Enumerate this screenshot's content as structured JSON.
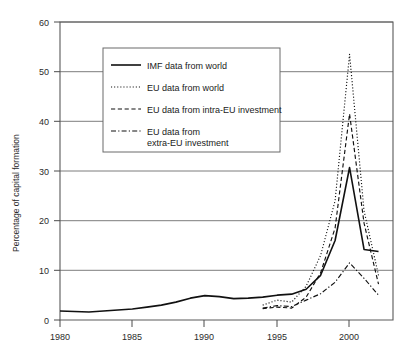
{
  "chart_data": {
    "type": "line",
    "title": "",
    "xlabel": "",
    "ylabel": "Percentage of capital formation",
    "xlim": [
      1980,
      2003
    ],
    "ylim": [
      0,
      60
    ],
    "yticks": [
      0,
      10,
      20,
      30,
      40,
      50,
      60
    ],
    "xticks": [
      1980,
      1985,
      1990,
      1995,
      2000
    ],
    "ytick_labels": [
      "0",
      "10",
      "20",
      "30",
      "40",
      "50",
      "60"
    ],
    "xtick_labels": [
      "1980",
      "1985",
      "1990",
      "1995",
      "2000"
    ],
    "grid": "horizontal",
    "legend_position": "upper-left-center",
    "series": [
      {
        "name": "IMF data from world",
        "style": "solid",
        "color": "#111111",
        "x": [
          1980,
          1981,
          1982,
          1983,
          1984,
          1985,
          1986,
          1987,
          1988,
          1989,
          1990,
          1991,
          1992,
          1993,
          1994,
          1995,
          1996,
          1997,
          1998,
          1999,
          2000,
          2001,
          2002
        ],
        "values": [
          1.8,
          1.7,
          1.6,
          1.8,
          2.0,
          2.2,
          2.6,
          3.0,
          3.6,
          4.4,
          4.9,
          4.7,
          4.3,
          4.4,
          4.6,
          5.0,
          5.2,
          6.2,
          9.0,
          16.0,
          30.7,
          14.2,
          13.8
        ]
      },
      {
        "name": "EU data  from world",
        "style": "dotted",
        "color": "#111111",
        "x": [
          1994,
          1995,
          1996,
          1997,
          1998,
          1999,
          2000,
          2001,
          2002
        ],
        "values": [
          3.0,
          4.0,
          3.6,
          6.8,
          13.0,
          24.0,
          53.5,
          22.0,
          9.0
        ]
      },
      {
        "name": "EU data from intra-EU investment",
        "style": "dashed",
        "color": "#111111",
        "x": [
          1994,
          1995,
          1996,
          1997,
          1998,
          1999,
          2000,
          2001,
          2002
        ],
        "values": [
          2.3,
          2.6,
          2.4,
          4.6,
          9.5,
          18.5,
          41.5,
          19.5,
          7.2
        ]
      },
      {
        "name": "EU data  from extra-EU investment",
        "style": "dashdot",
        "color": "#111111",
        "x": [
          1994,
          1995,
          1996,
          1997,
          1998,
          1999,
          2000,
          2001,
          2002
        ],
        "values": [
          2.4,
          2.9,
          2.7,
          4.0,
          5.3,
          7.6,
          11.5,
          8.4,
          5.0
        ]
      }
    ]
  },
  "legend": {
    "items": [
      {
        "label": "IMF data from world",
        "style": "solid"
      },
      {
        "label": "EU data  from world",
        "style": "dotted"
      },
      {
        "label": "EU data from intra-EU investment",
        "style": "dashed"
      },
      {
        "label": "EU data  from",
        "label2": "extra-EU investment",
        "style": "dashdot"
      }
    ]
  }
}
